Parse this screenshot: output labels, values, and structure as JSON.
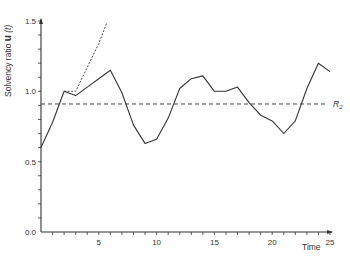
{
  "chart_data": {
    "type": "line",
    "title": "",
    "xlabel": "Time",
    "ylabel": "Solvency ratio u (t)",
    "ylabel_parts": {
      "text": "Solvency ratio",
      "bold": "u",
      "suffix": "(t)"
    },
    "xlim": [
      0,
      25
    ],
    "ylim": [
      0.0,
      1.5
    ],
    "x_ticks": [
      0,
      1,
      2,
      3,
      4,
      5,
      6,
      7,
      8,
      9,
      10,
      11,
      12,
      13,
      14,
      15,
      16,
      17,
      18,
      19,
      20,
      21,
      22,
      23,
      24,
      25
    ],
    "x_tick_labels": [
      {
        "x": 5,
        "label": "5"
      },
      {
        "x": 10,
        "label": "10"
      },
      {
        "x": 15,
        "label": "15"
      },
      {
        "x": 20,
        "label": "20"
      },
      {
        "x": 25,
        "label": "25"
      }
    ],
    "y_ticks": [
      0.0,
      0.1,
      0.2,
      0.3,
      0.4,
      0.5,
      0.6,
      0.7,
      0.8,
      0.9,
      1.0,
      1.1,
      1.2,
      1.3,
      1.4,
      1.5
    ],
    "y_tick_labels": [
      {
        "y": 0.0,
        "label": "0.0"
      },
      {
        "y": 0.5,
        "label": "0.5"
      },
      {
        "y": 1.0,
        "label": "1.0"
      },
      {
        "y": 1.5,
        "label": "1.5"
      }
    ],
    "grid": false,
    "legend": null,
    "series": [
      {
        "name": "solvency ratio u(t)",
        "style": "solid",
        "x": [
          0,
          1,
          2,
          3,
          4,
          5,
          6,
          7,
          8,
          9,
          10,
          11,
          12,
          13,
          14,
          15,
          16,
          17,
          18,
          19,
          20,
          21,
          22,
          23,
          24,
          25
        ],
        "values": [
          0.6,
          0.78,
          1.0,
          0.97,
          1.03,
          1.09,
          1.15,
          0.99,
          0.76,
          0.63,
          0.66,
          0.81,
          1.02,
          1.09,
          1.11,
          1.0,
          1.0,
          1.03,
          0.92,
          0.83,
          0.79,
          0.7,
          0.79,
          1.02,
          1.2,
          1.14
        ]
      },
      {
        "name": "alternative path",
        "style": "dotted",
        "x": [
          2,
          3,
          4,
          5,
          5.7
        ],
        "values": [
          1.0,
          1.0,
          1.17,
          1.34,
          1.49
        ]
      }
    ],
    "reference_lines": [
      {
        "name": "R2",
        "label": "R",
        "subscript": "2",
        "y": 0.91,
        "style": "dashed"
      }
    ]
  }
}
